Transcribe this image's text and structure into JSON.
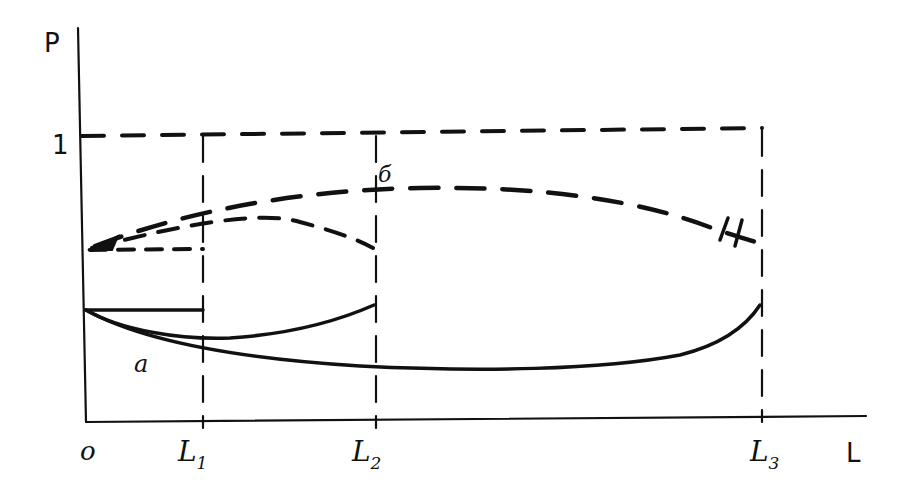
{
  "diagram": {
    "type": "hand-drawn sketch graph",
    "axes": {
      "y_label": "P",
      "x_label": "L",
      "origin_label": "o",
      "y_tick_label": "1"
    },
    "x_ticks": [
      {
        "main": "L",
        "sub": "1"
      },
      {
        "main": "L",
        "sub": "2"
      },
      {
        "main": "L",
        "sub": "3"
      }
    ],
    "curve_labels": {
      "solid": "a",
      "dashed": "б"
    },
    "colors": {
      "ink": "#111111",
      "background": "#ffffff"
    }
  }
}
